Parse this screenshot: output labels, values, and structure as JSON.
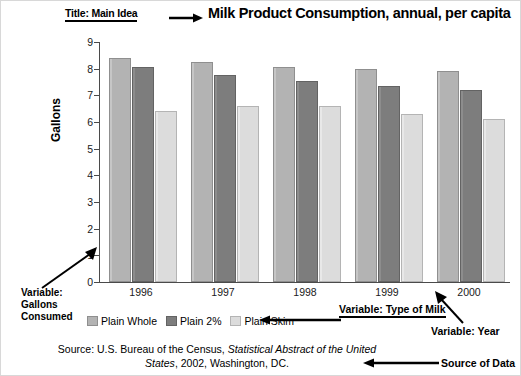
{
  "title": {
    "text": "Milk Product Consumption, annual, per capita",
    "annotation": "Title: Main Idea"
  },
  "axes": {
    "ylabel": "Gallons",
    "yticks": [
      "0",
      "1",
      "2",
      "3",
      "4",
      "5",
      "6",
      "7",
      "8",
      "9"
    ]
  },
  "legend": {
    "items": [
      {
        "label": "Plain Whole",
        "color": "#b3b3b3"
      },
      {
        "label": "Plain 2%",
        "color": "#7d7d7d"
      },
      {
        "label": "Plain Skim",
        "color": "#dcdcdc"
      }
    ]
  },
  "annotations": {
    "gallons_line1": "Variable:",
    "gallons_line2": "Gallons",
    "gallons_line3": "Consumed",
    "type_of_milk": "Variable: Type of Milk",
    "year": "Variable: Year",
    "source_of_data": "Source of Data"
  },
  "source": {
    "line1_pre": "Source: U.S. Bureau of the Census, ",
    "line1_italic": "Statistical Abstract of the United",
    "line2_italic": "States",
    "line2_post": ", 2002, Washington, DC."
  },
  "chart_data": {
    "type": "bar",
    "title": "Milk Product Consumption, annual, per capita",
    "xlabel": "",
    "ylabel": "Gallons",
    "ylim": [
      0,
      9
    ],
    "grid": false,
    "legend_position": "below-axis-left",
    "categories": [
      "1996",
      "1997",
      "1998",
      "1999",
      "2000"
    ],
    "series": [
      {
        "name": "Plain Whole",
        "color": "#b3b3b3",
        "values": [
          8.4,
          8.25,
          8.05,
          8.0,
          7.9
        ]
      },
      {
        "name": "Plain 2%",
        "color": "#7d7d7d",
        "values": [
          8.05,
          7.75,
          7.55,
          7.35,
          7.2
        ]
      },
      {
        "name": "Plain Skim",
        "color": "#dcdcdc",
        "values": [
          6.4,
          6.6,
          6.6,
          6.3,
          6.1
        ]
      }
    ]
  }
}
